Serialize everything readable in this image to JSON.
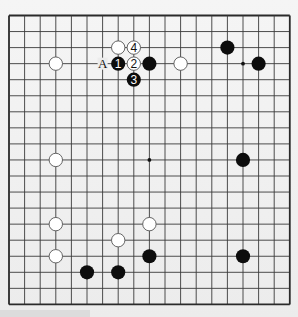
{
  "board": {
    "size": 19,
    "colors": {
      "background": "#ececec",
      "line": "#3a3a3a",
      "border": "#2a2a2a",
      "black_stone": "#0d0d0d",
      "white_stone": "#ffffff",
      "white_stroke": "#555555"
    },
    "hoshi": [
      {
        "col": 15,
        "row": 3
      },
      {
        "col": 9,
        "row": 9
      }
    ],
    "stones": [
      {
        "color": "white",
        "col": 7,
        "row": 2,
        "label": ""
      },
      {
        "color": "white",
        "col": 8,
        "row": 2,
        "label": "4"
      },
      {
        "color": "white",
        "col": 3,
        "row": 3,
        "label": ""
      },
      {
        "color": "black",
        "col": 7,
        "row": 3,
        "label": "1"
      },
      {
        "color": "white",
        "col": 8,
        "row": 3,
        "label": "2"
      },
      {
        "color": "black",
        "col": 9,
        "row": 3,
        "label": ""
      },
      {
        "color": "white",
        "col": 11,
        "row": 3,
        "label": ""
      },
      {
        "color": "black",
        "col": 8,
        "row": 4,
        "label": "3"
      },
      {
        "color": "black",
        "col": 14,
        "row": 2,
        "label": ""
      },
      {
        "color": "black",
        "col": 16,
        "row": 3,
        "label": ""
      },
      {
        "color": "white",
        "col": 3,
        "row": 9,
        "label": ""
      },
      {
        "color": "black",
        "col": 15,
        "row": 9,
        "label": ""
      },
      {
        "color": "white",
        "col": 3,
        "row": 13,
        "label": ""
      },
      {
        "color": "white",
        "col": 9,
        "row": 13,
        "label": ""
      },
      {
        "color": "white",
        "col": 7,
        "row": 14,
        "label": ""
      },
      {
        "color": "white",
        "col": 3,
        "row": 15,
        "label": ""
      },
      {
        "color": "black",
        "col": 9,
        "row": 15,
        "label": ""
      },
      {
        "color": "black",
        "col": 15,
        "row": 15,
        "label": ""
      },
      {
        "color": "black",
        "col": 5,
        "row": 16,
        "label": ""
      },
      {
        "color": "black",
        "col": 7,
        "row": 16,
        "label": ""
      }
    ],
    "markers": [
      {
        "text": "A",
        "col": 6,
        "row": 3
      }
    ]
  }
}
